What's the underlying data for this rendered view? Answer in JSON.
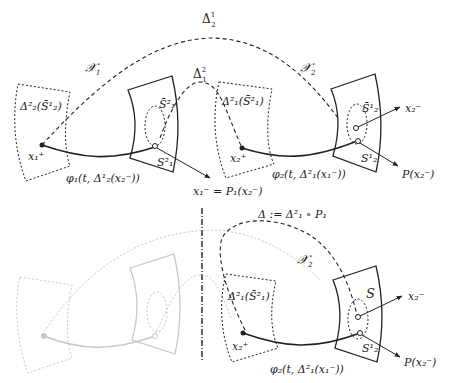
{
  "top_panel": {
    "labels": {
      "delta_2_1": "Δ",
      "delta_2_1_sup": "1",
      "delta_2_1_sub": "2",
      "X1": "𝒳",
      "X1_sub": "1",
      "X2": "𝒳",
      "X2_sub": "2",
      "delta_1_2": "Δ",
      "delta_1_2_sup": "2",
      "delta_1_2_sub": "1",
      "left_box": "Δ²₂(S̄¹₂)",
      "mid_box": "Δ²₁(S̄²₁)",
      "S1bar2": "S̄²₁",
      "S1_2": "S²₁",
      "S2bar1": "S̄¹₂",
      "S2_1": "S¹₂",
      "x1_plus": "x₁⁺",
      "x2_plus": "x₂⁺",
      "x2_minus": "x₂⁻",
      "phi1": "φ₁(t, Δ¹₂(x₂⁻))",
      "phi2": "φ₂(t, Δ²₁(x₁⁻))",
      "x1_minus_eq": "x₁⁻ = P₁(x₂⁻)",
      "P_x2": "P(x₂⁻)"
    }
  },
  "bottom_panel": {
    "labels": {
      "delta_def": "Δ := Δ²₁ ∘ P₁",
      "X2": "𝒳",
      "X2_sub": "2",
      "left_box": "Δ²₁(S̄²₁)",
      "S": "S",
      "S2_1": "S¹₂",
      "x2_plus": "x₂⁺",
      "x2_minus": "x₂⁻",
      "phi2": "φ₂(t, Δ²₁(x₁⁻))",
      "P_x2": "P(x₂⁻)"
    }
  }
}
